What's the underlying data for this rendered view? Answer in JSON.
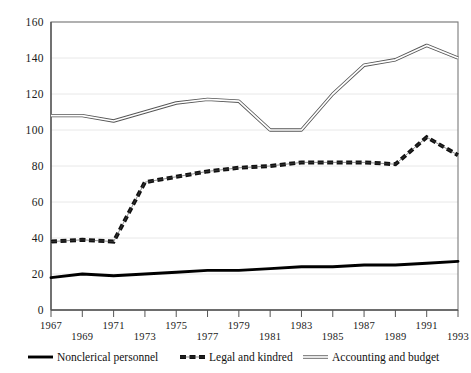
{
  "chart_data": {
    "type": "line",
    "title": "",
    "subtitle": "",
    "xlabel": "",
    "ylabel": "",
    "xlim": [
      1967,
      1993
    ],
    "ylim": [
      0,
      160
    ],
    "grid": true,
    "legend_position": "bottom",
    "y_ticks": [
      0,
      20,
      40,
      60,
      80,
      100,
      120,
      140,
      160
    ],
    "y_tick_labels": [
      "0",
      "20",
      "40",
      "60",
      "80",
      "100",
      "120",
      "140",
      "160"
    ],
    "x": [
      1967,
      1969,
      1971,
      1973,
      1975,
      1977,
      1979,
      1981,
      1983,
      1985,
      1987,
      1989,
      1991,
      1993
    ],
    "x_tick_labels": [
      "1967",
      "1969",
      "1971",
      "1973",
      "1975",
      "1977",
      "1979",
      "1981",
      "1983",
      "1985",
      "1987",
      "1989",
      "1991",
      "1993"
    ],
    "series": [
      {
        "name": "Nonclerical personnel",
        "style": "thick-solid",
        "color": "#000000",
        "values": [
          18,
          20,
          19,
          20,
          21,
          22,
          22,
          23,
          24,
          24,
          25,
          25,
          26,
          27
        ]
      },
      {
        "name": "Legal and kindred",
        "style": "dashed",
        "color": "#000000",
        "values": [
          38,
          39,
          38,
          71,
          74,
          77,
          79,
          80,
          82,
          82,
          82,
          81,
          96,
          86
        ]
      },
      {
        "name": "Accounting and budget",
        "style": "double-thin",
        "color": "#555555",
        "values": [
          108,
          108,
          105,
          110,
          115,
          117,
          116,
          100,
          100,
          120,
          136,
          139,
          147,
          140
        ]
      }
    ]
  },
  "legend": {
    "items": [
      {
        "label": "Nonclerical personnel",
        "marker": "thick-solid-line-marker"
      },
      {
        "label": "Legal and kindred",
        "marker": "dashed-line-marker"
      },
      {
        "label": "Accounting and budget",
        "marker": "double-thin-line-marker"
      }
    ]
  }
}
